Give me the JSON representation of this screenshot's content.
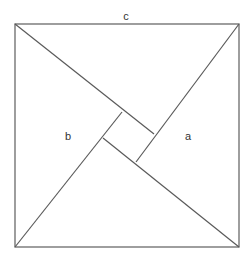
{
  "diagram": {
    "labels": {
      "top": "c",
      "left": "b",
      "right": "a"
    },
    "outer_square": {
      "top_left": [
        15,
        24
      ],
      "top_right": [
        239,
        24
      ],
      "bottom_right": [
        239,
        247
      ],
      "bottom_left": [
        15,
        247
      ]
    },
    "inner_square": {
      "top": [
        122,
        112
      ],
      "right": [
        154,
        134
      ],
      "bottom": [
        136,
        162
      ],
      "left": [
        103,
        138
      ]
    },
    "colors": {
      "line": "#5a5a5a",
      "background": "#ffffff",
      "text": "#333333"
    }
  }
}
